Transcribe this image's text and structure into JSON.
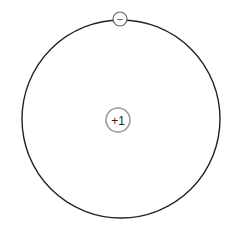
{
  "diagram": {
    "title": "",
    "orbit": {
      "cx": 121,
      "cy": 119,
      "r": 99,
      "stroke": "#222222"
    },
    "nucleus": {
      "label": "+1",
      "cx": 118,
      "cy": 120,
      "r": 12,
      "stroke": "#999999",
      "text_color": "#222222"
    },
    "electron": {
      "label": "−",
      "cx": 120,
      "cy": 19,
      "r": 7,
      "stroke": "#666666",
      "text_color": "#444444"
    }
  }
}
